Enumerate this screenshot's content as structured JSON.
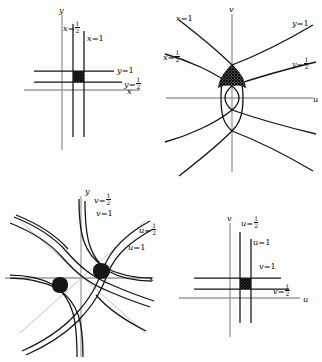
{
  "figure": {
    "title": "",
    "colors": {
      "background": "#fdfdfd",
      "curve": "#141414",
      "axis": "#8d8d8d",
      "shading": "#2a2a2a"
    }
  },
  "panels": [
    {
      "id": "xy-plane-lines",
      "name": "Top-left: lines x=1/2, x=1, y=1/2, y=1 in the xy-plane",
      "axes": {
        "horizontal": "x",
        "vertical": "y"
      },
      "labels": [
        {
          "id": "x-half",
          "var": "x",
          "value": "1/2",
          "text_plain": "x = 1/2"
        },
        {
          "id": "x-one",
          "var": "x",
          "value": "1",
          "text_plain": "x = 1"
        },
        {
          "id": "y-one",
          "var": "y",
          "value": "1",
          "text_plain": "y = 1"
        },
        {
          "id": "y-half",
          "var": "y",
          "value": "1/2",
          "text_plain": "y = 1/2"
        }
      ],
      "shaded_region": "square bounded by x=1/2, x=1, y=1/2, y=1"
    },
    {
      "id": "uv-plane-images",
      "name": "Top-right: images of the lines x=const, y=const as confocal parabolas in the uv-plane",
      "axes": {
        "horizontal": "u",
        "vertical": "v"
      },
      "labels": [
        {
          "id": "x-one",
          "var": "x",
          "value": "1",
          "text_plain": "x = 1"
        },
        {
          "id": "x-half",
          "var": "x",
          "value": "1/2",
          "text_plain": "x = 1/2"
        },
        {
          "id": "y-one",
          "var": "y",
          "value": "1",
          "text_plain": "y = 1"
        },
        {
          "id": "y-half",
          "var": "y",
          "value": "1/2",
          "text_plain": "y = 1/2"
        }
      ],
      "shaded_region": "curvilinear quadrilateral bounded by the four parabolic arcs"
    },
    {
      "id": "xy-plane-images",
      "name": "Bottom-left: images of the lines u=const, v=const as hyperbola-like curves in the xy-plane",
      "axes": {
        "horizontal": "x",
        "vertical": "y"
      },
      "labels": [
        {
          "id": "v-half",
          "var": "v",
          "value": "1/2",
          "text_plain": "v = 1/2"
        },
        {
          "id": "v-one",
          "var": "v",
          "value": "1",
          "text_plain": "v = 1"
        },
        {
          "id": "u-half",
          "var": "u",
          "value": "1/2",
          "text_plain": "u = 1/2"
        },
        {
          "id": "u-one",
          "var": "u",
          "value": "1",
          "text_plain": "u = 1"
        }
      ],
      "shaded_region": "two small curvilinear quadrilaterals, symmetric about the origin"
    },
    {
      "id": "uv-plane-lines",
      "name": "Bottom-right: lines u=1/2, u=1, v=1/2, v=1 in the uv-plane",
      "axes": {
        "horizontal": "u",
        "vertical": "v"
      },
      "labels": [
        {
          "id": "u-half",
          "var": "u",
          "value": "1/2",
          "text_plain": "u = 1/2"
        },
        {
          "id": "u-one",
          "var": "u",
          "value": "1",
          "text_plain": "u = 1"
        },
        {
          "id": "v-one",
          "var": "v",
          "value": "1",
          "text_plain": "v = 1"
        },
        {
          "id": "v-half",
          "var": "v",
          "value": "1/2",
          "text_plain": "v = 1/2"
        }
      ],
      "shaded_region": "square bounded by u=1/2, u=1, v=1/2, v=1"
    }
  ],
  "glyphs": {
    "equals": "=",
    "one": "1",
    "frac_num": "1",
    "frac_den": "2",
    "var_x": "x",
    "var_y": "y",
    "var_u": "u",
    "var_v": "v"
  }
}
